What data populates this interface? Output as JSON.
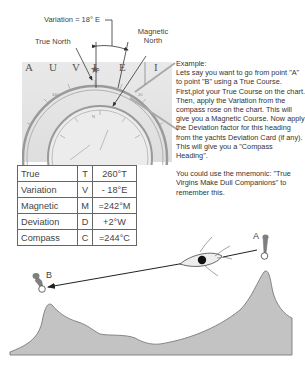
{
  "diagram": {
    "variation_label": "Variation = 18° E",
    "true_north_label": "True North",
    "magnetic_north_label": "Magnetic North",
    "magnetic_north_lines": [
      "Magnetic",
      "North"
    ],
    "chart_letters": [
      "A",
      "U",
      "V",
      "L",
      "E",
      "I"
    ],
    "point_a_label": "A",
    "point_b_label": "B",
    "colors": {
      "land": "#c2c2c2",
      "land_outline": "#777777",
      "chart_bg": "#e4e4e4",
      "buoy": "#8a8a8a",
      "table_border": "#666666"
    }
  },
  "example": {
    "heading": "Example:",
    "body": "Lets say you want to go from point \"A\" to point \"B\" using a True Course. First,plot your True Course on the chart. Then, apply the Variation from the compass rose on the chart. This will give you a Magnetic Course. Now apply the Deviation factor for this heading from the yachts Deviation Card (if any). This will give you a \"Compass Heading\".",
    "mnemonic": "You could use the mnemonic: \"True Virgins Make Dull Companions\" to remember this."
  },
  "table": {
    "rows": [
      {
        "name": "True",
        "abbr": "T",
        "value": "260°T"
      },
      {
        "name": "Variation",
        "abbr": "V",
        "value": "- 18°E"
      },
      {
        "name": "Magnetic",
        "abbr": "M",
        "value": "=242°M"
      },
      {
        "name": "Deviation",
        "abbr": "D",
        "value": "+2°W"
      },
      {
        "name": "Compass",
        "abbr": "C",
        "value": "=244°C"
      }
    ]
  }
}
